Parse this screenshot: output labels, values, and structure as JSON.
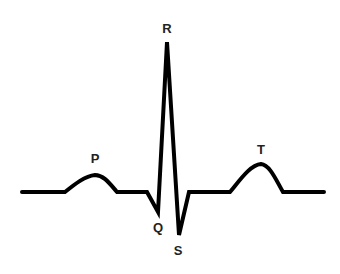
{
  "diagram": {
    "stroke_color": "#000000",
    "labels": [
      {
        "id": "P",
        "text": "P",
        "x": 95,
        "y": 163
      },
      {
        "id": "R",
        "text": "R",
        "x": 167,
        "y": 33
      },
      {
        "id": "Q",
        "text": "Q",
        "x": 158,
        "y": 232
      },
      {
        "id": "S",
        "text": "S",
        "x": 178,
        "y": 255
      },
      {
        "id": "T",
        "text": "T",
        "x": 261,
        "y": 154
      }
    ],
    "trace_points": [
      [
        22,
        192
      ],
      [
        65,
        192
      ],
      [
        95,
        175
      ],
      [
        117,
        192
      ],
      [
        147,
        192
      ],
      [
        158,
        212
      ],
      [
        167,
        42
      ],
      [
        179,
        235
      ],
      [
        189,
        192
      ],
      [
        230,
        192
      ],
      [
        261,
        164
      ],
      [
        283,
        192
      ],
      [
        324,
        192
      ]
    ]
  }
}
